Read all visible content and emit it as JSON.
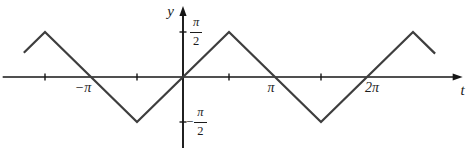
{
  "colors": {
    "background": "#ffffff",
    "axis": "#161616",
    "curve": "#3e3e3e",
    "text": "#1c1c1c"
  },
  "chart_data": {
    "type": "line",
    "title": "",
    "xlabel": "t",
    "ylabel": "y",
    "grid": false,
    "legend": "none",
    "units": "multiples of pi on both axes",
    "axes": {
      "t_range_pi": [
        -1.96,
        3.04
      ],
      "y_range_pi": [
        -0.79,
        0.79
      ]
    },
    "series": [
      {
        "name": "triangle-wave",
        "description": "Triangle wave, amplitude pi/2, period 2pi, vertices at odd multiples of pi/2",
        "points_pi": [
          [
            -1.73,
            0.27
          ],
          [
            -1.5,
            0.5
          ],
          [
            -0.5,
            -0.5
          ],
          [
            0.5,
            0.5
          ],
          [
            1.5,
            -0.5
          ],
          [
            2.5,
            0.5
          ],
          [
            2.74,
            0.26
          ]
        ]
      }
    ],
    "x_ticks_pi": [
      -1.5,
      -0.5,
      0.5,
      1.5
    ],
    "x_tick_labels": [
      {
        "value_pi": -1,
        "label": "−π"
      },
      {
        "value_pi": 1,
        "label": "π"
      },
      {
        "value_pi": 2,
        "label": "2π"
      }
    ],
    "y_tick_labels": [
      {
        "value_pi": 0.5,
        "sign": "",
        "num": "π",
        "den": "2"
      },
      {
        "value_pi": -0.5,
        "sign": "−",
        "num": "π",
        "den": "2"
      }
    ]
  }
}
